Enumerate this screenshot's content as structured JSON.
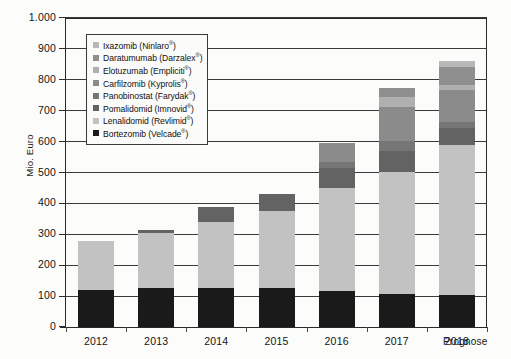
{
  "axes": {
    "y_title": "Mio. Euro",
    "y_ticks": [
      "0",
      "100",
      "200",
      "300",
      "400",
      "500",
      "600",
      "700",
      "800",
      "900",
      "1.000"
    ],
    "x_ticks": [
      "2012",
      "2013",
      "2014",
      "2015",
      "2016",
      "2017",
      "2018"
    ],
    "x_note": "Prognose"
  },
  "legend": {
    "items": [
      {
        "label": "Ixazomib (Ninlaro®)",
        "name": "ixazomib",
        "color": "#b8b8b8"
      },
      {
        "label": "Daratumumab (Darzalex®)",
        "name": "daratumumab",
        "color": "#8f8f8f"
      },
      {
        "label": "Elotuzumab (Empliciti®)",
        "name": "elotuzumab",
        "color": "#b0b0b0"
      },
      {
        "label": "Carfilzomib (Kyprolis®)",
        "name": "carfilzomib",
        "color": "#8b8b8b"
      },
      {
        "label": "Panobinostat (Farydak®)",
        "name": "panobinostat",
        "color": "#767676"
      },
      {
        "label": "Pomalidomid (Imnovid®)",
        "name": "pomalidomid",
        "color": "#636363"
      },
      {
        "label": "Lenalidomid (Revlimid®)",
        "name": "lenalidomid",
        "color": "#c2c2c2"
      },
      {
        "label": "Bortezomib (Velcade®)",
        "name": "bortezomib",
        "color": "#1a1a1a"
      }
    ]
  },
  "chart_data": {
    "type": "bar",
    "stacked": true,
    "title": "",
    "xlabel": "",
    "ylabel": "Mio. Euro",
    "ylim": [
      0,
      1000
    ],
    "ytick_step": 100,
    "grid": true,
    "legend_position": "inside-top-left",
    "annotation": "Prognose",
    "categories": [
      "2012",
      "2013",
      "2014",
      "2015",
      "2016",
      "2017",
      "2018"
    ],
    "series": [
      {
        "name": "Bortezomib (Velcade®)",
        "color": "#1a1a1a",
        "values": [
          120,
          125,
          125,
          125,
          115,
          108,
          103
        ]
      },
      {
        "name": "Lenalidomid (Revlimid®)",
        "color": "#c2c2c2",
        "values": [
          158,
          180,
          215,
          250,
          335,
          395,
          485
        ]
      },
      {
        "name": "Pomalidomid (Imnovid®)",
        "color": "#636363",
        "values": [
          0,
          8,
          48,
          57,
          65,
          68,
          55
        ]
      },
      {
        "name": "Panobinostat (Farydak®)",
        "color": "#767676",
        "values": [
          0,
          0,
          0,
          0,
          20,
          30,
          20
        ]
      },
      {
        "name": "Carfilzomib (Kyprolis®)",
        "color": "#8b8b8b",
        "values": [
          0,
          0,
          0,
          0,
          62,
          110,
          105
        ]
      },
      {
        "name": "Elotuzumab (Empliciti®)",
        "color": "#b0b0b0",
        "values": [
          0,
          0,
          0,
          0,
          0,
          35,
          15
        ]
      },
      {
        "name": "Daratumumab (Darzalex®)",
        "color": "#8f8f8f",
        "values": [
          0,
          0,
          0,
          0,
          0,
          29,
          60
        ]
      },
      {
        "name": "Ixazomib (Ninlaro®)",
        "color": "#b8b8b8",
        "values": [
          0,
          0,
          0,
          0,
          0,
          0,
          19
        ]
      }
    ],
    "totals": [
      278,
      313,
      388,
      432,
      597,
      775,
      862
    ]
  }
}
